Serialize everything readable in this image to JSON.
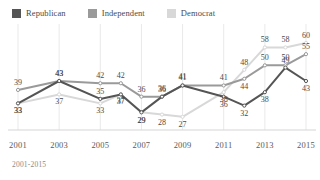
{
  "legend": {
    "items": [
      {
        "label": "Republican",
        "color": "#555555",
        "icon": "legend-swatch-icon"
      },
      {
        "label": "Independent",
        "color": "#9a9a9a",
        "icon": "legend-swatch-icon"
      },
      {
        "label": "Democrat",
        "color": "#d8d8d8",
        "icon": "legend-swatch-icon"
      }
    ]
  },
  "caption": "2001-2015",
  "chart_data": {
    "type": "line",
    "title": "",
    "subtitle": "",
    "xlabel": "",
    "ylabel": "",
    "x": [
      2001,
      2002,
      2003,
      2004,
      2005,
      2006,
      2007,
      2008,
      2009,
      2010,
      2011,
      2012,
      2013,
      2014,
      2015
    ],
    "tick_labels": [
      "2001",
      "2003",
      "2005",
      "2007",
      "2009",
      "2011",
      "2013",
      "2015"
    ],
    "tick_values": [
      2001,
      2003,
      2005,
      2007,
      2009,
      2011,
      2013,
      2015
    ],
    "ylim": [
      22,
      64
    ],
    "xlim": [
      2001,
      2015
    ],
    "grid": true,
    "grid_axis": "x",
    "legend_position": "top-left",
    "markers": true,
    "series": [
      {
        "name": "Republican",
        "color": "#555555",
        "x": [
          2001,
          2003,
          2005,
          2006,
          2007,
          2008,
          2009,
          2011,
          2012,
          2013,
          2014,
          2015
        ],
        "values": [
          33,
          43,
          35,
          37,
          29,
          36,
          41,
          36,
          32,
          38,
          49,
          43
        ],
        "labels": [
          "33",
          "43",
          "35",
          "37",
          "29",
          "36",
          "41",
          "36",
          "32",
          "38",
          "49",
          "43"
        ]
      },
      {
        "name": "Independent",
        "color": "#9a9a9a",
        "x": [
          2001,
          2003,
          2005,
          2006,
          2007,
          2008,
          2009,
          2011,
          2012,
          2013,
          2014,
          2015
        ],
        "values": [
          39,
          43,
          42,
          42,
          36,
          36,
          41,
          41,
          44,
          50,
          50,
          55
        ],
        "labels": [
          "39",
          "43",
          "42",
          "42",
          "36",
          "36",
          "41",
          "41",
          "44",
          "50",
          "50",
          "55"
        ]
      },
      {
        "name": "Democrat",
        "color": "#d8d8d8",
        "x": [
          2001,
          2003,
          2005,
          2006,
          2007,
          2008,
          2009,
          2011,
          2012,
          2013,
          2014,
          2015
        ],
        "values": [
          33,
          37,
          33,
          37,
          29,
          28,
          27,
          38,
          48,
          58,
          58,
          60
        ],
        "labels": [
          "33",
          "37",
          "33",
          "37",
          "29",
          "28",
          "27",
          "38",
          "48",
          "58",
          "58",
          "60"
        ]
      }
    ]
  }
}
